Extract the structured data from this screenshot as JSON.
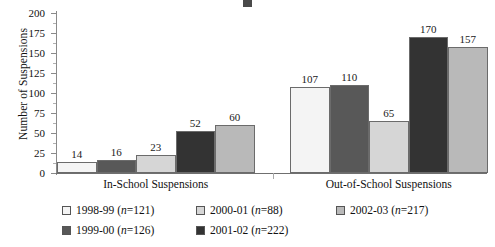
{
  "chart_data": {
    "type": "bar",
    "title": "",
    "xlabel": "",
    "ylabel": "Number of Suspensions",
    "ylim": [
      0,
      200
    ],
    "ytick_step": 25,
    "yticks": [
      0,
      25,
      50,
      75,
      100,
      125,
      150,
      175,
      200
    ],
    "ytick_labels": [
      "0",
      "25",
      "50",
      "75",
      "100",
      "125",
      "150",
      "175",
      "200"
    ],
    "grid": false,
    "legend_position": "bottom",
    "categories": [
      "In-School Suspensions",
      "Out-of-School Suspensions"
    ],
    "series": [
      {
        "name": "1998-99",
        "n": 121,
        "legend_label": "1998-99 (n=121)",
        "color": "#f4f4f4",
        "values": [
          14,
          16
        ],
        "value_labels": [
          "14",
          "107"
        ]
      },
      {
        "name": "1999-00",
        "n": 126,
        "legend_label": "1999-00 (n=126)",
        "color": "#585858",
        "values": [
          16,
          110
        ],
        "value_labels": [
          "16",
          "110"
        ]
      },
      {
        "name": "2000-01",
        "n": 88,
        "legend_label": "2000-01 (n=88)",
        "color": "#d6d6d6",
        "values": [
          23,
          65
        ],
        "value_labels": [
          "23",
          "65"
        ]
      },
      {
        "name": "2001-02",
        "n": 222,
        "legend_label": "2001-02 (n=222)",
        "color": "#333333",
        "values": [
          52,
          170
        ],
        "value_labels": [
          "52",
          "170"
        ]
      },
      {
        "name": "2002-03",
        "n": 217,
        "legend_label": "2002-03 (n=217)",
        "color": "#b9b9b9",
        "values": [
          60,
          157
        ],
        "value_labels": [
          "60",
          "157"
        ]
      }
    ],
    "group_values": {
      "In-School Suspensions": [
        14,
        16,
        23,
        52,
        60
      ],
      "Out-of-School Suspensions": [
        107,
        110,
        65,
        170,
        157
      ]
    }
  },
  "axis": {
    "y_title": "Number of Suspensions"
  },
  "legend": {
    "entries": [
      {
        "label": "1998-99",
        "n_prefix": "(",
        "n_label": "n",
        "n_value": "=121)",
        "color": "#f4f4f4"
      },
      {
        "label": "1999-00",
        "n_prefix": "(",
        "n_label": "n",
        "n_value": "=126)",
        "color": "#585858"
      },
      {
        "label": "2000-01",
        "n_prefix": "(",
        "n_label": "n",
        "n_value": "=88)",
        "color": "#d6d6d6"
      },
      {
        "label": "2001-02",
        "n_prefix": "(",
        "n_label": "n",
        "n_value": "=222)",
        "color": "#333333"
      },
      {
        "label": "2002-03",
        "n_prefix": "(",
        "n_label": "n",
        "n_value": "=217)",
        "color": "#b9b9b9"
      }
    ]
  }
}
